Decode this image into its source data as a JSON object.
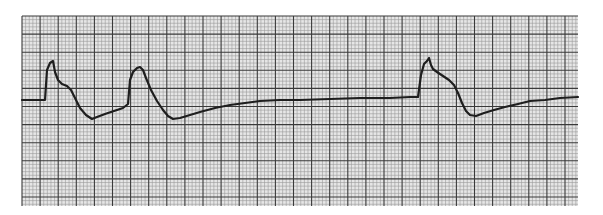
{
  "figure": {
    "type": "ecg-rhythm-strip",
    "background": "#ffffff",
    "paper_color": "#e6e6e6",
    "minor_grid_color": "#9a9a9a",
    "major_grid_color": "#3a3a3a",
    "trace_color": "#1e1e1e",
    "grid": {
      "left": 22,
      "top": 16,
      "right": 578,
      "bottom": 206,
      "major": 18.1,
      "minor_per_major": 5
    },
    "trace": "M22,100 L45,100 L47,70 L50,63 L53,61 L55,72 L58,80 L62,84 L67,86 L71,90 L75,98 L80,108 L86,115 L92,119 L97,117 L105,114 L114,111 L123,108 L128,104 L130,80 L133,72 L137,68 L140,67 L143,70 L146,78 L151,90 L157,101 L163,110 L168,116 L173,119 L180,118 L190,115 L200,112 L215,108 L230,105 L245,103 L260,101 L280,100 L300,100 L330,99 L360,98 L390,98 L410,97 L418,97 L421,75 L424,64 L427,61 L429,58 L431,65 L433,69 L437,72 L443,76 L449,80 L454,85 L458,93 L462,103 L466,111 L470,115 L476,116 L484,113 L494,110 L505,107 L518,104 L530,101 L545,100 L560,98 L578,97"
  }
}
